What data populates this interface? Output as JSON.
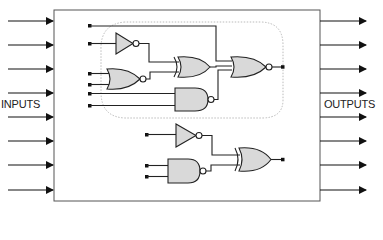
{
  "diagram": {
    "labels": {
      "inputs": "INPUTS",
      "outputs": "OUTPUTS"
    },
    "input_count": 8,
    "output_count": 8,
    "groups": [
      {
        "name": "upper-logic-cluster",
        "boundary": "dotted-rounded",
        "gates": [
          "NOT",
          "NOR",
          "XOR",
          "NAND",
          "NOR"
        ],
        "output_gate": "NOR"
      },
      {
        "name": "lower-logic-cluster",
        "boundary": "none",
        "gates": [
          "NOT",
          "NAND",
          "XOR"
        ],
        "output_gate": "XOR"
      }
    ],
    "colors": {
      "stroke": "#222222",
      "gate_fill": "#d9d9d9",
      "box_stroke": "#555555",
      "dotted_boundary": "#aaaaaa"
    }
  }
}
